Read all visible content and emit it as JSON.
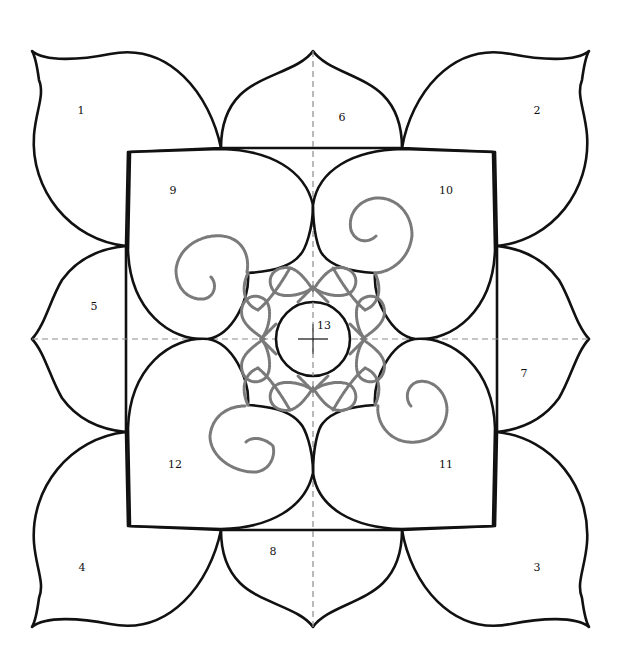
{
  "diagram": {
    "type": "quilt-block-pattern",
    "colors": {
      "outline": "#111111",
      "guide": "#8c8c8c",
      "quilting": "#7a7a7a",
      "background": "#ffffff"
    },
    "center": {
      "x": 313,
      "y": 339,
      "radius": 37
    },
    "regions": [
      {
        "id": "1",
        "label": "1",
        "shape": "outer-corner-petal",
        "position": "top-left",
        "x": 81,
        "y": 114
      },
      {
        "id": "2",
        "label": "2",
        "shape": "outer-corner-petal",
        "position": "top-right",
        "x": 537,
        "y": 114
      },
      {
        "id": "3",
        "label": "3",
        "shape": "outer-corner-petal",
        "position": "bottom-right",
        "x": 537,
        "y": 571
      },
      {
        "id": "4",
        "label": "4",
        "shape": "outer-corner-petal",
        "position": "bottom-left",
        "x": 82,
        "y": 571
      },
      {
        "id": "5",
        "label": "5",
        "shape": "side-petal",
        "position": "left",
        "x": 94,
        "y": 310
      },
      {
        "id": "6",
        "label": "6",
        "shape": "side-petal",
        "position": "top",
        "x": 342,
        "y": 121
      },
      {
        "id": "7",
        "label": "7",
        "shape": "side-petal",
        "position": "right",
        "x": 524,
        "y": 377
      },
      {
        "id": "8",
        "label": "8",
        "shape": "side-petal",
        "position": "bottom",
        "x": 273,
        "y": 555
      },
      {
        "id": "9",
        "label": "9",
        "shape": "heart-petal",
        "position": "upper-left",
        "x": 173,
        "y": 194
      },
      {
        "id": "10",
        "label": "10",
        "shape": "heart-petal",
        "position": "upper-right",
        "x": 446,
        "y": 194
      },
      {
        "id": "11",
        "label": "11",
        "shape": "heart-petal",
        "position": "lower-right",
        "x": 446,
        "y": 468
      },
      {
        "id": "12",
        "label": "12",
        "shape": "heart-petal",
        "position": "lower-left",
        "x": 175,
        "y": 468
      },
      {
        "id": "13",
        "label": "13",
        "shape": "center-circle",
        "position": "center",
        "x": 324,
        "y": 329
      }
    ],
    "guides": [
      "vertical-center-line",
      "horizontal-center-line"
    ],
    "quilting_motifs": [
      "spiral-9",
      "spiral-10",
      "spiral-11",
      "spiral-12",
      "inner-heart-ring"
    ]
  }
}
